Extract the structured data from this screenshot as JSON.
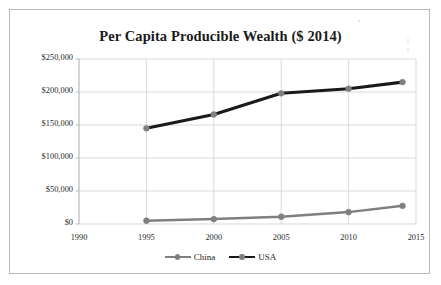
{
  "chart_data": {
    "type": "line",
    "title": "Per Capita Producible Wealth ($ 2014)",
    "xlabel": "",
    "ylabel": "",
    "x": [
      1995,
      2000,
      2005,
      2010,
      2014
    ],
    "xlim": [
      1990,
      2015
    ],
    "ylim": [
      0,
      250000
    ],
    "xticks": [
      "1990",
      "1995",
      "2000",
      "2005",
      "2010",
      "2015"
    ],
    "yticks": [
      "$0",
      "$50,000",
      "$100,000",
      "$150,000",
      "$200,000",
      "$250,000"
    ],
    "ytick_values": [
      0,
      50000,
      100000,
      150000,
      200000,
      250000
    ],
    "grid": true,
    "legend_position": "bottom",
    "series": [
      {
        "name": "China",
        "color": "#7f7f7f",
        "values": [
          5000,
          7500,
          11000,
          18000,
          27500
        ]
      },
      {
        "name": "USA",
        "color": "#1a1a1a",
        "values": [
          145000,
          166000,
          198000,
          205000,
          215000
        ]
      }
    ]
  },
  "legend": {
    "items": [
      {
        "label": "China",
        "color": "#7f7f7f"
      },
      {
        "label": "USA",
        "color": "#1a1a1a"
      }
    ]
  },
  "style": {
    "border_color": "#b9b9b9",
    "grid_color": "#d6d6d6",
    "axis_color": "#bdbdbd",
    "text_color": "#2b2b2b",
    "marker_color": "#808080",
    "background": "#ffffff"
  }
}
